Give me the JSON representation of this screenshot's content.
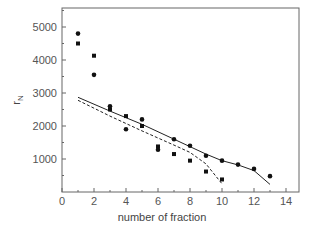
{
  "chart_data": {
    "type": "scatter",
    "title": "",
    "xlabel": "number of fraction",
    "ylabel": "r",
    "ylabel_subscript": "N",
    "xlim": [
      0,
      15
    ],
    "ylim": [
      0,
      5500
    ],
    "xticks": [
      0,
      2,
      4,
      6,
      8,
      10,
      12,
      14
    ],
    "yticks": [
      1000,
      2000,
      3000,
      4000,
      5000
    ],
    "grid": false,
    "legend": null,
    "series": [
      {
        "name": "circles",
        "marker": "circle",
        "points": [
          [
            1,
            4800
          ],
          [
            2,
            3550
          ],
          [
            3,
            2600
          ],
          [
            4,
            1900
          ],
          [
            5,
            2200
          ],
          [
            6,
            1280
          ],
          [
            7,
            1600
          ],
          [
            8,
            1400
          ],
          [
            9,
            1100
          ],
          [
            10,
            950
          ],
          [
            11,
            830
          ],
          [
            12,
            700
          ],
          [
            13,
            480
          ]
        ]
      },
      {
        "name": "squares",
        "marker": "square",
        "points": [
          [
            1,
            4500
          ],
          [
            2,
            4130
          ],
          [
            3,
            2500
          ],
          [
            4,
            2300
          ],
          [
            5,
            2000
          ],
          [
            6,
            1380
          ],
          [
            7,
            1150
          ],
          [
            8,
            950
          ],
          [
            9,
            620
          ],
          [
            10,
            380
          ]
        ]
      },
      {
        "name": "solid-fit",
        "line": "solid",
        "points": [
          [
            1,
            2870
          ],
          [
            3,
            2450
          ],
          [
            5,
            2050
          ],
          [
            7,
            1600
          ],
          [
            9,
            1150
          ],
          [
            10,
            950
          ],
          [
            11,
            820
          ],
          [
            12,
            650
          ],
          [
            13,
            230
          ]
        ]
      },
      {
        "name": "dashed-fit",
        "line": "dashed",
        "points": [
          [
            1,
            2780
          ],
          [
            3,
            2300
          ],
          [
            5,
            1850
          ],
          [
            7,
            1420
          ],
          [
            8,
            1200
          ],
          [
            9,
            850
          ],
          [
            10,
            250
          ]
        ]
      }
    ]
  },
  "axes": {
    "x_tick_labels": [
      "0",
      "2",
      "4",
      "6",
      "8",
      "10",
      "12",
      "14"
    ],
    "y_tick_labels": [
      "1000",
      "2000",
      "3000",
      "4000",
      "5000"
    ],
    "xlabel": "number of fraction",
    "ylabel_main": "r",
    "ylabel_sub": "N"
  },
  "colors": {
    "axis": "#666666",
    "marker": "#111111",
    "line": "#222222"
  }
}
